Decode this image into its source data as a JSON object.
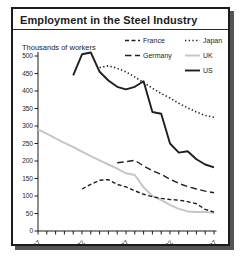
{
  "card": {
    "title": "Employment in the Steel Industry"
  },
  "chart_data": {
    "type": "line",
    "title": "Employment in the Steel Industry",
    "ylabel": "Thousands of workers",
    "xlabel": "",
    "grid": false,
    "ylim": [
      0,
      500
    ],
    "y_tick_step": 50,
    "x_range": [
      1967,
      1987
    ],
    "x_tick_step": 1,
    "x_labeled_ticks": [
      1967,
      1972,
      1977,
      1982,
      1987
    ],
    "legend_position": "top-right",
    "legend_columns": [
      [
        "France",
        "Germany"
      ],
      [
        "Japan",
        "UK",
        "US"
      ]
    ],
    "axis_color": "#1c1c1c",
    "series": [
      {
        "name": "France",
        "color": "#1f1f1f",
        "stroke_width": 1.4,
        "dash": "4 2.5",
        "points": [
          [
            1972,
            120
          ],
          [
            1973,
            133
          ],
          [
            1974,
            145
          ],
          [
            1975,
            147
          ],
          [
            1976,
            133
          ],
          [
            1977,
            126
          ],
          [
            1978,
            115
          ],
          [
            1979,
            105
          ],
          [
            1980,
            98
          ],
          [
            1981,
            93
          ],
          [
            1982,
            90
          ],
          [
            1983,
            88
          ],
          [
            1984,
            84
          ],
          [
            1985,
            78
          ],
          [
            1986,
            62
          ],
          [
            1987,
            54
          ]
        ]
      },
      {
        "name": "Germany",
        "color": "#1f1f1f",
        "stroke_width": 1.4,
        "dash": "6.5 3.5",
        "points": [
          [
            1976,
            195
          ],
          [
            1977,
            198
          ],
          [
            1978,
            202
          ],
          [
            1979,
            186
          ],
          [
            1980,
            172
          ],
          [
            1981,
            162
          ],
          [
            1982,
            148
          ],
          [
            1983,
            136
          ],
          [
            1984,
            127
          ],
          [
            1985,
            120
          ],
          [
            1986,
            114
          ],
          [
            1987,
            109
          ]
        ]
      },
      {
        "name": "Japan",
        "color": "#1f1f1f",
        "stroke_width": 1.6,
        "dash": "1.3 2.4",
        "points": [
          [
            1974,
            467
          ],
          [
            1975,
            472
          ],
          [
            1976,
            465
          ],
          [
            1977,
            455
          ],
          [
            1978,
            440
          ],
          [
            1979,
            424
          ],
          [
            1980,
            408
          ],
          [
            1981,
            393
          ],
          [
            1982,
            380
          ],
          [
            1983,
            365
          ],
          [
            1984,
            352
          ],
          [
            1985,
            340
          ],
          [
            1986,
            330
          ],
          [
            1987,
            325
          ]
        ]
      },
      {
        "name": "UK",
        "color": "#c6c6c6",
        "stroke_width": 2,
        "dash": null,
        "points": [
          [
            1967,
            290
          ],
          [
            1968,
            278
          ],
          [
            1969,
            265
          ],
          [
            1970,
            252
          ],
          [
            1971,
            240
          ],
          [
            1972,
            227
          ],
          [
            1973,
            214
          ],
          [
            1974,
            202
          ],
          [
            1975,
            190
          ],
          [
            1976,
            178
          ],
          [
            1977,
            165
          ],
          [
            1978,
            160
          ],
          [
            1979,
            125
          ],
          [
            1980,
            100
          ],
          [
            1981,
            88
          ],
          [
            1982,
            75
          ],
          [
            1983,
            63
          ],
          [
            1984,
            56
          ],
          [
            1985,
            54
          ],
          [
            1986,
            54
          ],
          [
            1987,
            52
          ]
        ]
      },
      {
        "name": "US",
        "color": "#1f1f1f",
        "stroke_width": 1.9,
        "dash": null,
        "points": [
          [
            1971,
            445
          ],
          [
            1972,
            505
          ],
          [
            1973,
            510
          ],
          [
            1974,
            455
          ],
          [
            1975,
            430
          ],
          [
            1976,
            412
          ],
          [
            1977,
            405
          ],
          [
            1978,
            412
          ],
          [
            1979,
            428
          ],
          [
            1980,
            340
          ],
          [
            1981,
            335
          ],
          [
            1982,
            250
          ],
          [
            1983,
            224
          ],
          [
            1984,
            228
          ],
          [
            1985,
            205
          ],
          [
            1986,
            190
          ],
          [
            1987,
            182
          ]
        ]
      }
    ]
  }
}
